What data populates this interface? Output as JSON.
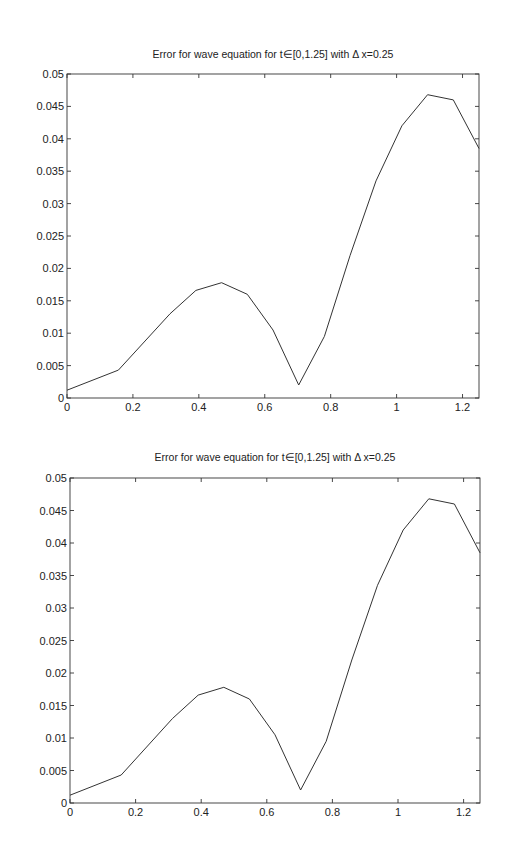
{
  "chart_data": [
    {
      "type": "line",
      "title": "Error for wave equation for t∈[0,1.25] with Δ x=0.25",
      "xlabel": "",
      "ylabel": "",
      "xlim": [
        0,
        1.25
      ],
      "ylim": [
        0,
        0.05
      ],
      "grid": false,
      "legend": null,
      "x_ticks": [
        "0",
        "0.2",
        "0.4",
        "0.6",
        "0.8",
        "1",
        "1.2"
      ],
      "x_tick_values": [
        0,
        0.2,
        0.4,
        0.6,
        0.8,
        1,
        1.2
      ],
      "y_ticks": [
        "0",
        "0.005",
        "0.01",
        "0.015",
        "0.02",
        "0.025",
        "0.03",
        "0.035",
        "0.04",
        "0.045",
        "0.05"
      ],
      "y_tick_values": [
        0,
        0.005,
        0.01,
        0.015,
        0.02,
        0.025,
        0.03,
        0.035,
        0.04,
        0.045,
        0.05
      ],
      "series": [
        {
          "name": "error",
          "x": [
            0,
            0.156,
            0.3125,
            0.391,
            0.469,
            0.547,
            0.625,
            0.703,
            0.781,
            0.859,
            0.9375,
            1.016,
            1.094,
            1.172,
            1.25
          ],
          "values": [
            0.0012,
            0.0043,
            0.013,
            0.0166,
            0.0178,
            0.016,
            0.0105,
            0.002,
            0.0095,
            0.022,
            0.0335,
            0.042,
            0.0468,
            0.046,
            0.0385
          ]
        }
      ]
    },
    {
      "type": "line",
      "title": "Error for wave equation for t∈[0,1.25] with Δ x=0.25",
      "xlabel": "",
      "ylabel": "",
      "xlim": [
        0,
        1.25
      ],
      "ylim": [
        0,
        0.05
      ],
      "grid": false,
      "legend": null,
      "x_ticks": [
        "0",
        "0.2",
        "0.4",
        "0.6",
        "0.8",
        "1",
        "1.2"
      ],
      "x_tick_values": [
        0,
        0.2,
        0.4,
        0.6,
        0.8,
        1,
        1.2
      ],
      "y_ticks": [
        "0",
        "0.005",
        "0.01",
        "0.015",
        "0.02",
        "0.025",
        "0.03",
        "0.035",
        "0.04",
        "0.045",
        "0.05"
      ],
      "y_tick_values": [
        0,
        0.005,
        0.01,
        0.015,
        0.02,
        0.025,
        0.03,
        0.035,
        0.04,
        0.045,
        0.05
      ],
      "series": [
        {
          "name": "error",
          "x": [
            0,
            0.156,
            0.3125,
            0.391,
            0.469,
            0.547,
            0.625,
            0.703,
            0.781,
            0.859,
            0.9375,
            1.016,
            1.094,
            1.172,
            1.25
          ],
          "values": [
            0.0012,
            0.0043,
            0.013,
            0.0166,
            0.0178,
            0.016,
            0.0105,
            0.002,
            0.0095,
            0.022,
            0.0335,
            0.042,
            0.0468,
            0.046,
            0.0385
          ]
        }
      ]
    }
  ],
  "layout": {
    "plots": [
      {
        "left": 67,
        "right": 479,
        "top": 74,
        "bottom": 398,
        "title_y": 58
      },
      {
        "left": 70,
        "right": 480,
        "top": 478,
        "bottom": 803,
        "title_y": 461
      }
    ]
  }
}
